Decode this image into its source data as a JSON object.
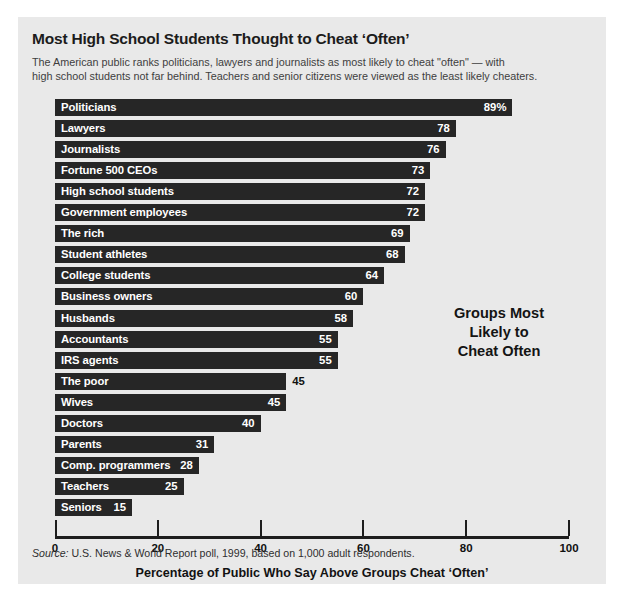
{
  "panel": {
    "title": "Most High School Students Thought to Cheat ‘Often’",
    "subtitle_line1": "The American public ranks politicians, lawyers and journalists as most likely to cheat \"often\" — with",
    "subtitle_line2": "high school students not far behind. Teachers and senior citizens were viewed as the least likely cheaters.",
    "annotation_line1": "Groups Most",
    "annotation_line2": "Likely to",
    "annotation_line3": "Cheat Often",
    "source_label": "Source:",
    "source_text": " U.S. News & World Report poll, 1999, based on 1,000 adult respondents.",
    "bar_color": "#262626",
    "background_color": "#e9e9e9",
    "axis_color": "#1d1d1d"
  },
  "chart_data": {
    "type": "bar",
    "orientation": "horizontal",
    "title": "Most High School Students Thought to Cheat ‘Often’",
    "subtitle": "The American public ranks politicians, lawyers and journalists as most likely to cheat \"often\" — with high school students not far behind. Teachers and senior citizens were viewed as the least likely cheaters.",
    "xlabel": "Percentage of Public Who Say Above Groups Cheat ‘Often’",
    "ylabel": "",
    "xlim": [
      0,
      100
    ],
    "xticks": [
      0,
      20,
      40,
      60,
      80,
      100
    ],
    "xtick_labels": [
      "0",
      "20",
      "40",
      "60",
      "80",
      "100"
    ],
    "grid": false,
    "legend": null,
    "annotation": "Groups Most Likely to Cheat Often",
    "source": "Source: U.S. News & World Report poll, 1999, based on 1,000 adult respondents.",
    "categories": [
      "Politicians",
      "Lawyers",
      "Journalists",
      "Fortune 500 CEOs",
      "High school students",
      "Government employees",
      "The rich",
      "Student athletes",
      "College students",
      "Business owners",
      "Husbands",
      "Accountants",
      "IRS agents",
      "The poor",
      "Wives",
      "Doctors",
      "Parents",
      "Comp. programmers",
      "Teachers",
      "Seniors"
    ],
    "values": [
      89,
      78,
      76,
      73,
      72,
      72,
      69,
      68,
      64,
      60,
      58,
      55,
      55,
      45,
      45,
      40,
      31,
      28,
      25,
      15
    ],
    "value_labels": [
      "89%",
      "78",
      "76",
      "73",
      "72",
      "72",
      "69",
      "68",
      "64",
      "60",
      "58",
      "55",
      "55",
      "45",
      "45",
      "40",
      "31",
      "28",
      "25",
      "15"
    ],
    "label_placement": [
      "inside",
      "inside",
      "inside",
      "inside",
      "inside",
      "inside",
      "inside",
      "inside",
      "inside",
      "inside",
      "inside",
      "inside",
      "inside",
      "outside",
      "inside",
      "inside",
      "inside",
      "inside",
      "inside",
      "inside"
    ]
  }
}
